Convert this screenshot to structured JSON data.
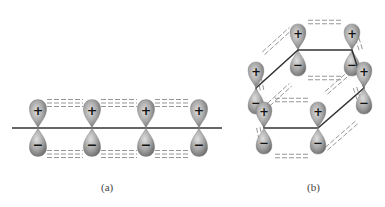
{
  "figure": {
    "panels": [
      {
        "id": "a",
        "caption": "(a)",
        "description": "Linear chain of p orbitals on a horizontal axis, side-by-side overlap (pi bonding)",
        "axis_line": {
          "x1": 12,
          "y1": 128,
          "x2": 222,
          "y2": 128
        },
        "orbitals": [
          {
            "x": 38,
            "y": 128,
            "upper_sign": "+",
            "lower_sign": "−"
          },
          {
            "x": 92,
            "y": 128,
            "upper_sign": "+",
            "lower_sign": "−"
          },
          {
            "x": 146,
            "y": 128,
            "upper_sign": "+",
            "lower_sign": "−"
          },
          {
            "x": 199,
            "y": 128,
            "upper_sign": "+",
            "lower_sign": "−"
          }
        ]
      },
      {
        "id": "b",
        "caption": "(b)",
        "description": "Hexagonal ring of six p orbitals (benzene-like), delocalized pi overlap",
        "ring_vertices": [
          {
            "name": "top-back-left",
            "x": 298,
            "y": 50
          },
          {
            "name": "top-back-right",
            "x": 352,
            "y": 50
          },
          {
            "name": "right",
            "x": 364,
            "y": 88
          },
          {
            "name": "front-right",
            "x": 318,
            "y": 128
          },
          {
            "name": "front-left",
            "x": 264,
            "y": 128
          },
          {
            "name": "left",
            "x": 256,
            "y": 88
          }
        ],
        "orbitals": [
          {
            "vertex": 0,
            "upper_sign": "+",
            "lower_sign": "−"
          },
          {
            "vertex": 1,
            "upper_sign": "+",
            "lower_sign": "−"
          },
          {
            "vertex": 2,
            "upper_sign": "+",
            "lower_sign": "−"
          },
          {
            "vertex": 3,
            "upper_sign": "+",
            "lower_sign": "−"
          },
          {
            "vertex": 4,
            "upper_sign": "+",
            "lower_sign": "−"
          },
          {
            "vertex": 5,
            "upper_sign": "+",
            "lower_sign": "−"
          }
        ]
      }
    ],
    "colors": {
      "lobe_dark": "#7a7a7a",
      "lobe_light": "#d4d4d4",
      "line": "#333333",
      "dash": "#8a8a8a",
      "sign": "#111111"
    }
  }
}
